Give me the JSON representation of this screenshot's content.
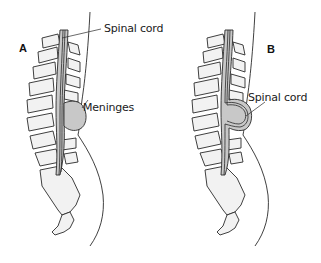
{
  "diagram": {
    "panels": [
      {
        "id": "A",
        "letter": "A",
        "labels": {
          "top": "Spinal cord",
          "sac": "Meninges"
        }
      },
      {
        "id": "B",
        "letter": "B",
        "labels": {
          "sac": "Spinal cord"
        }
      }
    ],
    "colors": {
      "stroke": "#2a2a2a",
      "fill_gray": "#c8c8c8",
      "fill_light": "#f2f2f2",
      "background": "#ffffff"
    }
  }
}
